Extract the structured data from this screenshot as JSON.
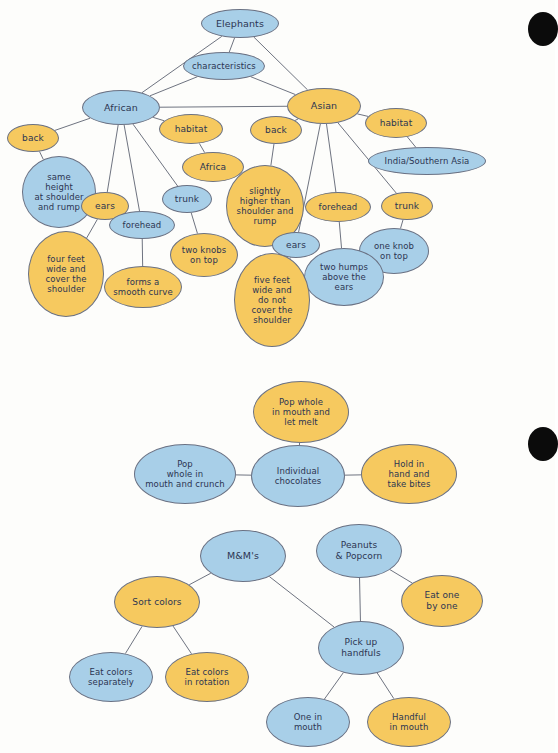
{
  "page": {
    "background_color": "#fdfdfb",
    "node_blue": "#a8cfe8",
    "node_yellow": "#f6c95f",
    "edge_color": "#5d6372",
    "text_color": "#2c3552"
  },
  "edge_marks": [
    {
      "name": "page-edge-mark-top",
      "x": 528,
      "y": 12,
      "w": 30,
      "h": 34
    },
    {
      "name": "page-edge-mark-middle",
      "x": 528,
      "y": 427,
      "w": 30,
      "h": 34
    }
  ],
  "diagrams": [
    {
      "id": "elephants",
      "title": "Elephants",
      "nodes": [
        {
          "id": "elephants",
          "label": "Elephants",
          "color": "blue",
          "x": 201,
          "y": 9,
          "w": 78,
          "h": 29,
          "fs": 9.5
        },
        {
          "id": "characteristics",
          "label": "characteristics",
          "color": "blue",
          "x": 183,
          "y": 52,
          "w": 82,
          "h": 28,
          "fs": 8.5
        },
        {
          "id": "african",
          "label": "African",
          "color": "blue",
          "x": 82,
          "y": 90,
          "w": 78,
          "h": 35,
          "fs": 9.5
        },
        {
          "id": "asian",
          "label": "Asian",
          "color": "yellow",
          "x": 287,
          "y": 88,
          "w": 74,
          "h": 36,
          "fs": 9.5
        },
        {
          "id": "afr-back",
          "label": "back",
          "color": "yellow",
          "x": 7,
          "y": 124,
          "w": 52,
          "h": 28,
          "fs": 9
        },
        {
          "id": "afr-habitat",
          "label": "habitat",
          "color": "yellow",
          "x": 159,
          "y": 114,
          "w": 64,
          "h": 30,
          "fs": 9
        },
        {
          "id": "afr-africa",
          "label": "Africa",
          "color": "yellow",
          "x": 182,
          "y": 152,
          "w": 62,
          "h": 30,
          "fs": 9
        },
        {
          "id": "afr-back-desc",
          "label": "same\nheight\nat shoulder\nand rump",
          "color": "blue",
          "x": 22,
          "y": 156,
          "w": 74,
          "h": 72,
          "fs": 8.5
        },
        {
          "id": "afr-ears",
          "label": "ears",
          "color": "yellow",
          "x": 81,
          "y": 192,
          "w": 48,
          "h": 28,
          "fs": 9
        },
        {
          "id": "afr-forehead",
          "label": "forehead",
          "color": "blue",
          "x": 109,
          "y": 211,
          "w": 66,
          "h": 28,
          "fs": 8.5
        },
        {
          "id": "afr-trunk",
          "label": "trunk",
          "color": "blue",
          "x": 162,
          "y": 185,
          "w": 50,
          "h": 28,
          "fs": 9
        },
        {
          "id": "afr-ears-desc",
          "label": "four feet\nwide and\ncover the\nshoulder",
          "color": "yellow",
          "x": 28,
          "y": 231,
          "w": 76,
          "h": 86,
          "fs": 8.5
        },
        {
          "id": "afr-forehead-desc",
          "label": "forms a\nsmooth curve",
          "color": "yellow",
          "x": 104,
          "y": 266,
          "w": 78,
          "h": 42,
          "fs": 8.5
        },
        {
          "id": "afr-trunk-desc",
          "label": "two knobs\non top",
          "color": "yellow",
          "x": 170,
          "y": 233,
          "w": 68,
          "h": 44,
          "fs": 8.5
        },
        {
          "id": "asi-back",
          "label": "back",
          "color": "yellow",
          "x": 250,
          "y": 116,
          "w": 52,
          "h": 28,
          "fs": 9
        },
        {
          "id": "asi-habitat",
          "label": "habitat",
          "color": "yellow",
          "x": 365,
          "y": 108,
          "w": 62,
          "h": 30,
          "fs": 9
        },
        {
          "id": "asi-habitat-desc",
          "label": "India/Southern Asia",
          "color": "blue",
          "x": 368,
          "y": 147,
          "w": 118,
          "h": 28,
          "fs": 8.5
        },
        {
          "id": "asi-back-desc",
          "label": "slightly\nhigher than\nshoulder and\nrump",
          "color": "yellow",
          "x": 226,
          "y": 165,
          "w": 78,
          "h": 82,
          "fs": 8.5
        },
        {
          "id": "asi-forehead",
          "label": "forehead",
          "color": "yellow",
          "x": 305,
          "y": 192,
          "w": 66,
          "h": 30,
          "fs": 8.5
        },
        {
          "id": "asi-trunk",
          "label": "trunk",
          "color": "yellow",
          "x": 381,
          "y": 192,
          "w": 52,
          "h": 28,
          "fs": 9
        },
        {
          "id": "asi-ears",
          "label": "ears",
          "color": "blue",
          "x": 272,
          "y": 232,
          "w": 48,
          "h": 26,
          "fs": 9
        },
        {
          "id": "asi-trunk-desc",
          "label": "one knob\non top",
          "color": "blue",
          "x": 359,
          "y": 228,
          "w": 70,
          "h": 46,
          "fs": 8.5
        },
        {
          "id": "asi-forehead-desc",
          "label": "two humps\nabove the\nears",
          "color": "blue",
          "x": 304,
          "y": 248,
          "w": 80,
          "h": 58,
          "fs": 8.5
        },
        {
          "id": "asi-ears-desc",
          "label": "five feet\nwide and\ndo not\ncover the\nshoulder",
          "color": "yellow",
          "x": 234,
          "y": 253,
          "w": 76,
          "h": 94,
          "fs": 8.5
        }
      ],
      "edges": [
        [
          "elephants",
          "characteristics"
        ],
        [
          "elephants",
          "african"
        ],
        [
          "elephants",
          "asian"
        ],
        [
          "characteristics",
          "african"
        ],
        [
          "characteristics",
          "asian"
        ],
        [
          "african",
          "asian"
        ],
        [
          "african",
          "afr-back"
        ],
        [
          "african",
          "afr-ears"
        ],
        [
          "african",
          "afr-forehead"
        ],
        [
          "african",
          "afr-trunk"
        ],
        [
          "afr-back",
          "afr-back-desc"
        ],
        [
          "afr-habitat",
          "afr-africa"
        ],
        [
          "african",
          "afr-habitat"
        ],
        [
          "afr-ears",
          "afr-ears-desc"
        ],
        [
          "afr-forehead",
          "afr-forehead-desc"
        ],
        [
          "afr-trunk",
          "afr-trunk-desc"
        ],
        [
          "asian",
          "asi-back"
        ],
        [
          "asian",
          "asi-habitat"
        ],
        [
          "asian",
          "asi-forehead"
        ],
        [
          "asian",
          "asi-trunk"
        ],
        [
          "asian",
          "asi-ears"
        ],
        [
          "asi-back",
          "asi-back-desc"
        ],
        [
          "asi-habitat",
          "asi-habitat-desc"
        ],
        [
          "asi-forehead",
          "asi-forehead-desc"
        ],
        [
          "asi-trunk",
          "asi-trunk-desc"
        ],
        [
          "asi-ears",
          "asi-ears-desc"
        ]
      ]
    },
    {
      "id": "snacks",
      "title": "Individual chocolates",
      "nodes": [
        {
          "id": "pop-melt",
          "label": "Pop whole\nin mouth and\nlet melt",
          "color": "yellow",
          "x": 253,
          "y": 381,
          "w": 96,
          "h": 62,
          "fs": 8.5
        },
        {
          "id": "individual",
          "label": "Individual\nchocolates",
          "color": "blue",
          "x": 251,
          "y": 445,
          "w": 94,
          "h": 62,
          "fs": 8.5
        },
        {
          "id": "pop-crunch",
          "label": "Pop\nwhole in\nmouth and crunch",
          "color": "blue",
          "x": 134,
          "y": 444,
          "w": 102,
          "h": 60,
          "fs": 8.5
        },
        {
          "id": "hold-bites",
          "label": "Hold in\nhand and\ntake bites",
          "color": "yellow",
          "x": 361,
          "y": 444,
          "w": 96,
          "h": 60,
          "fs": 8.5
        },
        {
          "id": "mms",
          "label": "M&M's",
          "color": "blue",
          "x": 200,
          "y": 530,
          "w": 86,
          "h": 52,
          "fs": 9.5
        },
        {
          "id": "peanuts",
          "label": "Peanuts\n& Popcorn",
          "color": "blue",
          "x": 316,
          "y": 524,
          "w": 86,
          "h": 54,
          "fs": 9
        },
        {
          "id": "sort-colors",
          "label": "Sort colors",
          "color": "yellow",
          "x": 114,
          "y": 576,
          "w": 86,
          "h": 52,
          "fs": 9
        },
        {
          "id": "eat-one",
          "label": "Eat one\nby one",
          "color": "yellow",
          "x": 401,
          "y": 575,
          "w": 82,
          "h": 52,
          "fs": 9
        },
        {
          "id": "pick-handfuls",
          "label": "Pick up\nhandfuls",
          "color": "blue",
          "x": 318,
          "y": 621,
          "w": 86,
          "h": 54,
          "fs": 9
        },
        {
          "id": "eat-separate",
          "label": "Eat colors\nseparately",
          "color": "blue",
          "x": 69,
          "y": 652,
          "w": 84,
          "h": 50,
          "fs": 8.5
        },
        {
          "id": "eat-rotation",
          "label": "Eat colors\nin rotation",
          "color": "yellow",
          "x": 165,
          "y": 652,
          "w": 84,
          "h": 50,
          "fs": 8.5
        },
        {
          "id": "one-in-mouth",
          "label": "One in\nmouth",
          "color": "blue",
          "x": 266,
          "y": 697,
          "w": 84,
          "h": 50,
          "fs": 8.5
        },
        {
          "id": "handful-mouth",
          "label": "Handful\nin mouth",
          "color": "yellow",
          "x": 367,
          "y": 697,
          "w": 84,
          "h": 50,
          "fs": 8.5
        }
      ],
      "edges": [
        [
          "pop-melt",
          "individual"
        ],
        [
          "pop-crunch",
          "individual"
        ],
        [
          "individual",
          "hold-bites"
        ],
        [
          "mms",
          "sort-colors"
        ],
        [
          "mms",
          "pick-handfuls"
        ],
        [
          "peanuts",
          "pick-handfuls"
        ],
        [
          "peanuts",
          "eat-one"
        ],
        [
          "sort-colors",
          "eat-separate"
        ],
        [
          "sort-colors",
          "eat-rotation"
        ],
        [
          "pick-handfuls",
          "one-in-mouth"
        ],
        [
          "pick-handfuls",
          "handful-mouth"
        ]
      ]
    }
  ]
}
